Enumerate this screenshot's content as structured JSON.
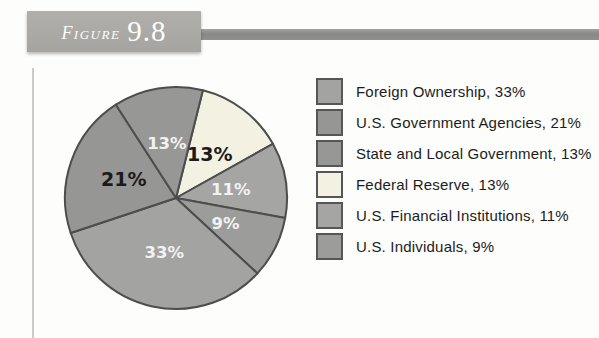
{
  "figure_header": {
    "label": "Figure",
    "number": "9.8"
  },
  "chart_data": {
    "type": "pie",
    "title": "",
    "legend_position": "right",
    "direction": "clockwise",
    "start_angle_deg": 14,
    "outline_color": "#4d4d4d",
    "slices": [
      {
        "label": "Federal Reserve",
        "value": 13,
        "display": "13%",
        "color": "#f3f1e1",
        "text_color": "#1b1b1b"
      },
      {
        "label": "U.S. Financial Institutions",
        "value": 11,
        "display": "11%",
        "color": "#a5a5a3",
        "text_color": "#f2f2f2"
      },
      {
        "label": "U.S. Individuals",
        "value": 9,
        "display": "9%",
        "color": "#9c9c9a",
        "text_color": "#f2f2f2"
      },
      {
        "label": "Foreign Ownership",
        "value": 33,
        "display": "33%",
        "color": "#a3a3a1",
        "text_color": "#f2f2f2"
      },
      {
        "label": "U.S. Government Agencies",
        "value": 21,
        "display": "21%",
        "color": "#969695",
        "text_color": "#1b1b1b"
      },
      {
        "label": "State and Local Government",
        "value": 13,
        "display": "13%",
        "color": "#979796",
        "text_color": "#f2f2f2"
      }
    ],
    "legend": [
      {
        "label": "Foreign Ownership, 33%",
        "color": "#a3a3a1"
      },
      {
        "label": "U.S. Government Agencies, 21%",
        "color": "#969695"
      },
      {
        "label": "State and Local Government, 13%",
        "color": "#979796"
      },
      {
        "label": "Federal Reserve, 13%",
        "color": "#f3f1e1"
      },
      {
        "label": "U.S. Financial Institutions, 11%",
        "color": "#a5a5a3"
      },
      {
        "label": "U.S. Individuals, 9%",
        "color": "#9c9c9a"
      }
    ]
  }
}
